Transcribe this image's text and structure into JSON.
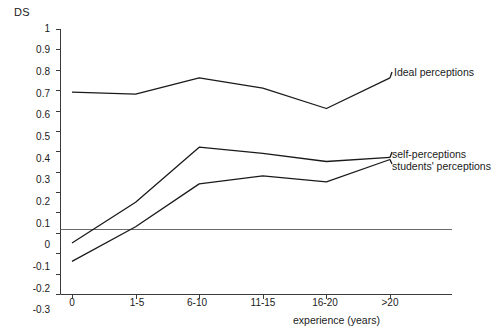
{
  "chart_data": {
    "type": "line",
    "title": "",
    "subtitle": "",
    "xlabel": "experience (years)",
    "ylabel": "DS",
    "categories": [
      "0",
      "1-5",
      "6-10",
      "11-15",
      "16-20",
      ">20"
    ],
    "ylim": [
      -0.3,
      1.0
    ],
    "ytick_labels": [
      "1",
      "0.9",
      "0.8",
      "0.7",
      "0.6",
      "0.5",
      "0.4",
      "0.3",
      "0.2",
      "0.1",
      "0",
      "-0.1",
      "-0.2",
      "-0.3"
    ],
    "ytick_values": [
      1,
      0.9,
      0.8,
      0.7,
      0.6,
      0.5,
      0.4,
      0.3,
      0.2,
      0.1,
      0,
      -0.1,
      -0.2,
      -0.3
    ],
    "grid": false,
    "legend_position": "right-inline-labels",
    "zero_reference_line": 0,
    "line_color": "#1a1a1a",
    "axis_color": "#3a3a3a",
    "series": [
      {
        "name": "Ideal perceptions",
        "values": [
          0.69,
          0.68,
          0.76,
          0.71,
          0.61,
          0.76
        ]
      },
      {
        "name": "self-perceptions",
        "values": [
          -0.05,
          0.15,
          0.42,
          0.39,
          0.35,
          0.37
        ]
      },
      {
        "name": "students' perceptions",
        "values": [
          -0.14,
          0.03,
          0.24,
          0.28,
          0.25,
          0.36
        ]
      }
    ]
  },
  "labels": {
    "y_axis_title": "DS",
    "x_axis_title": "experience (years)",
    "series_ideal": "Ideal perceptions",
    "series_self": "self-perceptions",
    "series_students": "students' perceptions",
    "y_1": "1",
    "y_09": "0.9",
    "y_08": "0.8",
    "y_07": "0.7",
    "y_06": "0.6",
    "y_05": "0.5",
    "y_04": "0.4",
    "y_03": "0.3",
    "y_02": "0.2",
    "y_01": "0.1",
    "y_0": "0",
    "y_m01": "-0.1",
    "y_m02": "-0.2",
    "y_m03": "-0.3",
    "x_0": "0",
    "x_1_5": "1-5",
    "x_6_10": "6-10",
    "x_11_15": "11-15",
    "x_16_20": "16-20",
    "x_gt20": ">20"
  }
}
